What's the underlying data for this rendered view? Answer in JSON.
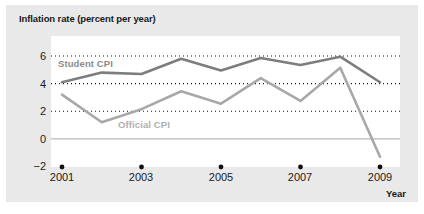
{
  "chart_data": {
    "type": "line",
    "title": "Inflation rate (percent per year)",
    "xlabel": "Year",
    "ylabel": "",
    "xlim": [
      2001,
      2009
    ],
    "ylim": [
      -2,
      6.6
    ],
    "ytick_labels": [
      "6",
      "4",
      "2",
      "0",
      "−2"
    ],
    "yticks": [
      6,
      4,
      2,
      0,
      -2
    ],
    "xtick_labels": [
      "2001",
      "2003",
      "2005",
      "2007",
      "2009"
    ],
    "xticks": [
      2001,
      2003,
      2005,
      2007,
      2009
    ],
    "grid": "horizontal dotted gridlines at 2, 4 and 6; solid line at 0",
    "legend_position": "inline labels on plot",
    "x": [
      2001,
      2002,
      2003,
      2004,
      2005,
      2006,
      2007,
      2008,
      2009
    ],
    "series": [
      {
        "name": "Student CPI",
        "color": "#7d7d7d",
        "values": [
          4.1,
          4.8,
          4.7,
          5.8,
          4.95,
          5.85,
          5.35,
          5.95,
          4.1
        ]
      },
      {
        "name": "Official CPI",
        "color": "#a8a8a8",
        "values": [
          3.2,
          1.2,
          2.15,
          3.45,
          2.55,
          4.4,
          2.75,
          5.15,
          -1.3
        ]
      }
    ],
    "xtick_markers": {
      "shape": "dot",
      "color": "#111111",
      "at_value": -2
    },
    "colors": {
      "panel_background": "#e9e9e9",
      "plot_background": "#ffffff",
      "text": "#1a1a1a",
      "gridline": "#1a1a1a",
      "zero_line": "#b9b9b9",
      "student_cpi_label": "#8b8b8b",
      "official_cpi_label": "#b0b0b0"
    }
  }
}
